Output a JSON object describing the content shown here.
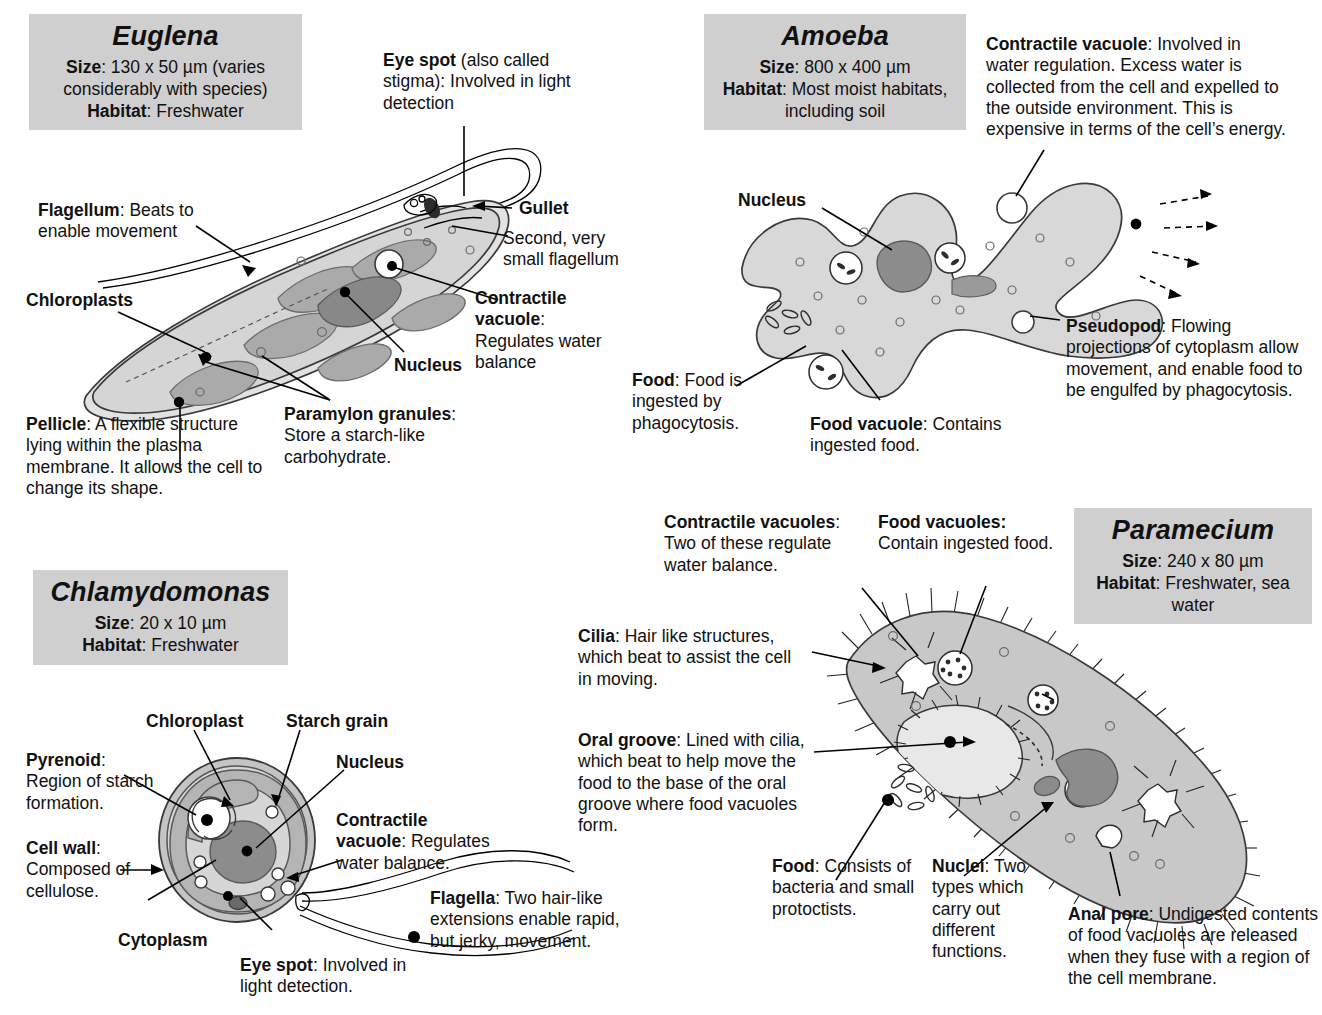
{
  "page": {
    "palette": {
      "infobox_bg": "#cfcfcf",
      "cytoplasm": "#c9c9c9",
      "cytoplasm_light": "#dcdcdc",
      "chloroplast": "#a8a8a8",
      "nucleus": "#8a8a8a",
      "outline": "#3a3a3a",
      "text": "#111111"
    }
  },
  "euglena": {
    "info": {
      "species": "Euglena",
      "size_label": "Size",
      "size_value": ": 130 x 50 µm (varies considerably with species)",
      "habitat_label": "Habitat",
      "habitat_value": ": Freshwater"
    },
    "labels": {
      "eye_spot": {
        "term": "Eye spot",
        "text": " (also called stigma): Involved in light detection"
      },
      "flagellum": {
        "term": "Flagellum",
        "text": ": Beats to enable  movement"
      },
      "chloroplasts": {
        "term": "Chloroplasts",
        "text": ""
      },
      "gullet": {
        "term": "Gullet",
        "text": ""
      },
      "second_flagellum": {
        "term": "",
        "text": "Second, very small flagellum"
      },
      "contractile_vacuole": {
        "term": "Contractile vacuole",
        "text": ": Regulates water balance"
      },
      "nucleus": {
        "term": "Nucleus",
        "text": ""
      },
      "paramylon": {
        "term": "Paramylon granules",
        "text": ": Store a starch-like carbohydrate."
      },
      "pellicle": {
        "term": "Pellicle",
        "text": ": A flexible structure lying within the plasma membrane. It allows the cell to change its shape."
      }
    }
  },
  "amoeba": {
    "info": {
      "species": "Amoeba",
      "size_label": "Size",
      "size_value": ": 800 x 400 µm",
      "habitat_label": "Habitat",
      "habitat_value": ": Most moist habitats, including soil"
    },
    "labels": {
      "contractile_vacuole": {
        "term": "Contractile vacuole",
        "text": ": Involved in water regulation. Excess water is collected from the cell and expelled to the outside environment. This is expensive in terms of the cell’s energy."
      },
      "nucleus": {
        "term": "Nucleus",
        "text": ""
      },
      "food": {
        "term": "Food",
        "text": ": Food is ingested by phagocytosis."
      },
      "food_vacuole": {
        "term": "Food vacuole",
        "text": ": Contains ingested food."
      },
      "pseudopod": {
        "term": "Pseudopod",
        "text": ": Flowing projections of cytoplasm allow movement, and enable food to be engulfed by phagocytosis."
      }
    }
  },
  "chlamydomonas": {
    "info": {
      "species": "Chlamydomonas",
      "size_label": "Size",
      "size_value": ": 20 x 10 µm",
      "habitat_label": "Habitat",
      "habitat_value": ": Freshwater"
    },
    "labels": {
      "chloroplast": {
        "term": "Chloroplast",
        "text": ""
      },
      "starch_grain": {
        "term": "Starch grain",
        "text": ""
      },
      "pyrenoid": {
        "term": "Pyrenoid",
        "text": ": Region of starch formation."
      },
      "nucleus": {
        "term": "Nucleus",
        "text": ""
      },
      "contractile_vacuole": {
        "term": "Contractile vacuole",
        "text": ": Regulates water balance."
      },
      "cell_wall": {
        "term": "Cell wall",
        "text": ": Composed of cellulose."
      },
      "cytoplasm": {
        "term": "Cytoplasm",
        "text": ""
      },
      "eye_spot": {
        "term": "Eye spot",
        "text": ": Involved in light detection."
      },
      "flagella": {
        "term": "Flagella",
        "text": ": Two hair-like extensions enable rapid, but jerky, movement."
      }
    }
  },
  "paramecium": {
    "info": {
      "species": "Paramecium",
      "size_label": "Size",
      "size_value": ": 240 x 80 µm",
      "habitat_label": "Habitat",
      "habitat_value": ": Freshwater, sea water"
    },
    "labels": {
      "contractile_vacuoles": {
        "term": "Contractile vacuoles",
        "text": ": Two of these regulate water balance."
      },
      "food_vacuoles": {
        "term": "Food vacuoles:",
        "text": " Contain ingested food."
      },
      "cilia": {
        "term": "Cilia",
        "text": ": Hair like structures, which beat to assist the cell in moving."
      },
      "oral_groove": {
        "term": "Oral groove",
        "text": ": Lined with cilia, which beat to help move the food to the base of the oral groove where food vacuoles form."
      },
      "food": {
        "term": "Food",
        "text": ": Consists of bacteria and small protoctists."
      },
      "nuclei": {
        "term": "Nuclei",
        "text": ": Two types which carry out different functions."
      },
      "anal_pore": {
        "term": "Anal pore",
        "text": ": Undigested contents of food vacuoles are released when they fuse with a region of the cell membrane."
      }
    }
  }
}
